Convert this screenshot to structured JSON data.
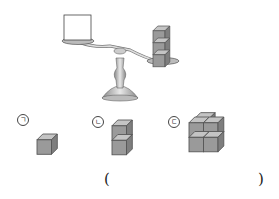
{
  "figure": {
    "scale": {
      "left_pan_item": "empty box",
      "right_pan_item": "stack of 3 cubes",
      "right_cube_count": 3
    },
    "options": [
      {
        "label": "ㄱ",
        "cube_count": 1,
        "arrangement": "single cube"
      },
      {
        "label": "ㄴ",
        "cube_count": 2,
        "arrangement": "2 cubes stacked vertically"
      },
      {
        "label": "ㄷ",
        "cube_count": 4,
        "arrangement": "2x2 cubes (2 wide, 2 tall)"
      }
    ],
    "answer_blank": {
      "open": "(",
      "close": ")"
    }
  },
  "colors": {
    "cube_front": "#9a9a9a",
    "cube_top": "#c4c4c4",
    "cube_side": "#7e7e7e",
    "metal": "#b8b8b8"
  }
}
